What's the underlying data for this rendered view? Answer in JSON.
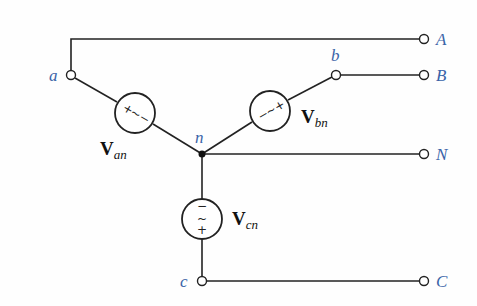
{
  "diagram": {
    "colors": {
      "wire": "#222222",
      "node_label": "#3a64a8",
      "source_label": "#111111"
    },
    "nodes": {
      "a": "a",
      "b": "b",
      "c": "c",
      "n": "n"
    },
    "terminals": {
      "A": "A",
      "B": "B",
      "N": "N",
      "C": "C"
    },
    "sources": {
      "an": {
        "main": "V",
        "sub": "an",
        "plus": "+",
        "minus": "−",
        "symbol": "~"
      },
      "bn": {
        "main": "V",
        "sub": "bn",
        "plus": "+",
        "minus": "−",
        "symbol": "~"
      },
      "cn": {
        "main": "V",
        "sub": "cn",
        "plus": "+",
        "minus": "−",
        "symbol": "~"
      }
    }
  }
}
